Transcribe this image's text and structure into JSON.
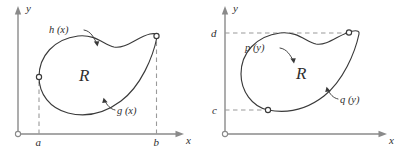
{
  "figure": {
    "caption_region_symbol": "R",
    "stroke_color": "#3a3a3a",
    "axis_color": "#8a8a8a",
    "dash_color": "#9a9a9a",
    "background": "#ffffff"
  },
  "panels": [
    {
      "id": "left",
      "description": "x-simple region bounded above by h(x) and below by g(x) between x = a and x = b",
      "axes": {
        "x_label": "x",
        "y_label": "y",
        "origin_marker": "open-circle"
      },
      "region_label": "R",
      "boundary_labels": [
        {
          "name": "upper-curve",
          "text": "h (x)"
        },
        {
          "name": "lower-curve",
          "text": "g (x)"
        }
      ],
      "tick_labels": [
        {
          "name": "x-lower-bound",
          "text": "a"
        },
        {
          "name": "x-upper-bound",
          "text": "b"
        }
      ],
      "dashed_guides": [
        {
          "name": "vertical-guide-a",
          "orientation": "vertical"
        },
        {
          "name": "vertical-guide-b",
          "orientation": "vertical"
        }
      ],
      "node_markers": 2
    },
    {
      "id": "right",
      "description": "y-simple region bounded on the left by p(y) and on the right by q(y) between y = c and y = d",
      "axes": {
        "x_label": "x",
        "y_label": "y",
        "origin_marker": "open-circle"
      },
      "region_label": "R",
      "boundary_labels": [
        {
          "name": "left-curve",
          "text": "p (y)"
        },
        {
          "name": "right-curve",
          "text": "q (y)"
        }
      ],
      "tick_labels": [
        {
          "name": "y-upper-bound",
          "text": "d"
        },
        {
          "name": "y-lower-bound",
          "text": "c"
        }
      ],
      "dashed_guides": [
        {
          "name": "horizontal-guide-d",
          "orientation": "horizontal"
        },
        {
          "name": "horizontal-guide-c",
          "orientation": "horizontal"
        }
      ],
      "node_markers": 2
    }
  ]
}
